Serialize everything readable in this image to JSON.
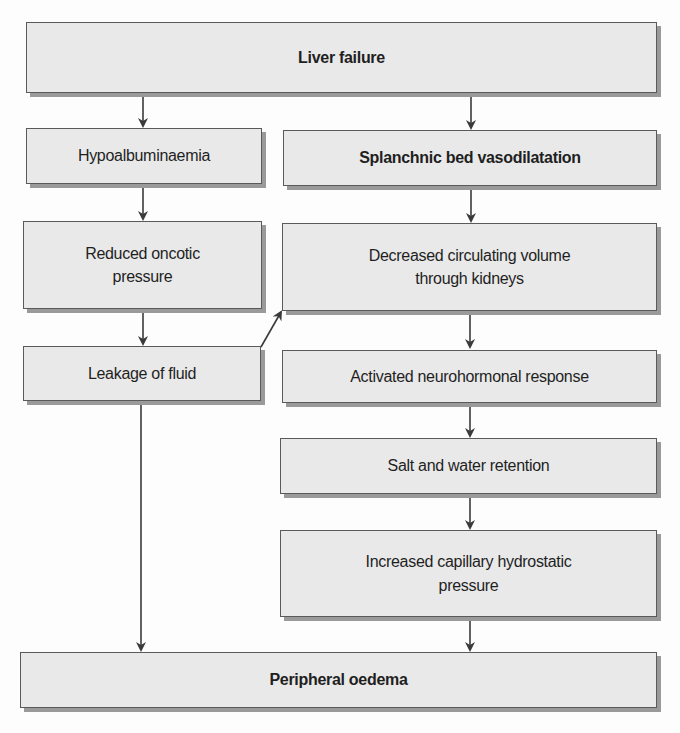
{
  "diagram": {
    "type": "flowchart",
    "nodes": [
      {
        "id": "liver_failure",
        "label": "Liver failure",
        "bold": true
      },
      {
        "id": "hypoalbuminaemia",
        "label": "Hypoalbuminaemia",
        "bold": false
      },
      {
        "id": "splanchnic",
        "label": "Splanchnic bed vasodilatation",
        "bold": true
      },
      {
        "id": "reduced_oncotic",
        "label_line1": "Reduced oncotic",
        "label_line2": "pressure",
        "bold": false
      },
      {
        "id": "decreased_volume",
        "label_line1": "Decreased circulating volume",
        "label_line2": "through kidneys",
        "bold": false
      },
      {
        "id": "leakage",
        "label": "Leakage of fluid",
        "bold": false
      },
      {
        "id": "neurohormonal",
        "label": "Activated neurohormonal response",
        "bold": false
      },
      {
        "id": "salt_water",
        "label": "Salt and water retention",
        "bold": false
      },
      {
        "id": "capillary",
        "label_line1": "Increased capillary hydrostatic",
        "label_line2": "pressure",
        "bold": false
      },
      {
        "id": "oedema",
        "label": "Peripheral oedema",
        "bold": true
      }
    ],
    "edges": [
      [
        "liver_failure",
        "hypoalbuminaemia"
      ],
      [
        "liver_failure",
        "splanchnic"
      ],
      [
        "hypoalbuminaemia",
        "reduced_oncotic"
      ],
      [
        "reduced_oncotic",
        "leakage"
      ],
      [
        "leakage",
        "decreased_volume"
      ],
      [
        "leakage",
        "oedema"
      ],
      [
        "splanchnic",
        "decreased_volume"
      ],
      [
        "decreased_volume",
        "neurohormonal"
      ],
      [
        "neurohormonal",
        "salt_water"
      ],
      [
        "salt_water",
        "capillary"
      ],
      [
        "capillary",
        "oedema"
      ]
    ],
    "colors": {
      "box_fill": "#e9e9e9",
      "box_border": "#5a5a5a",
      "box_shadow": "#9a9a9a",
      "arrow": "#3a3a3a",
      "text": "#1f1f1f"
    }
  }
}
